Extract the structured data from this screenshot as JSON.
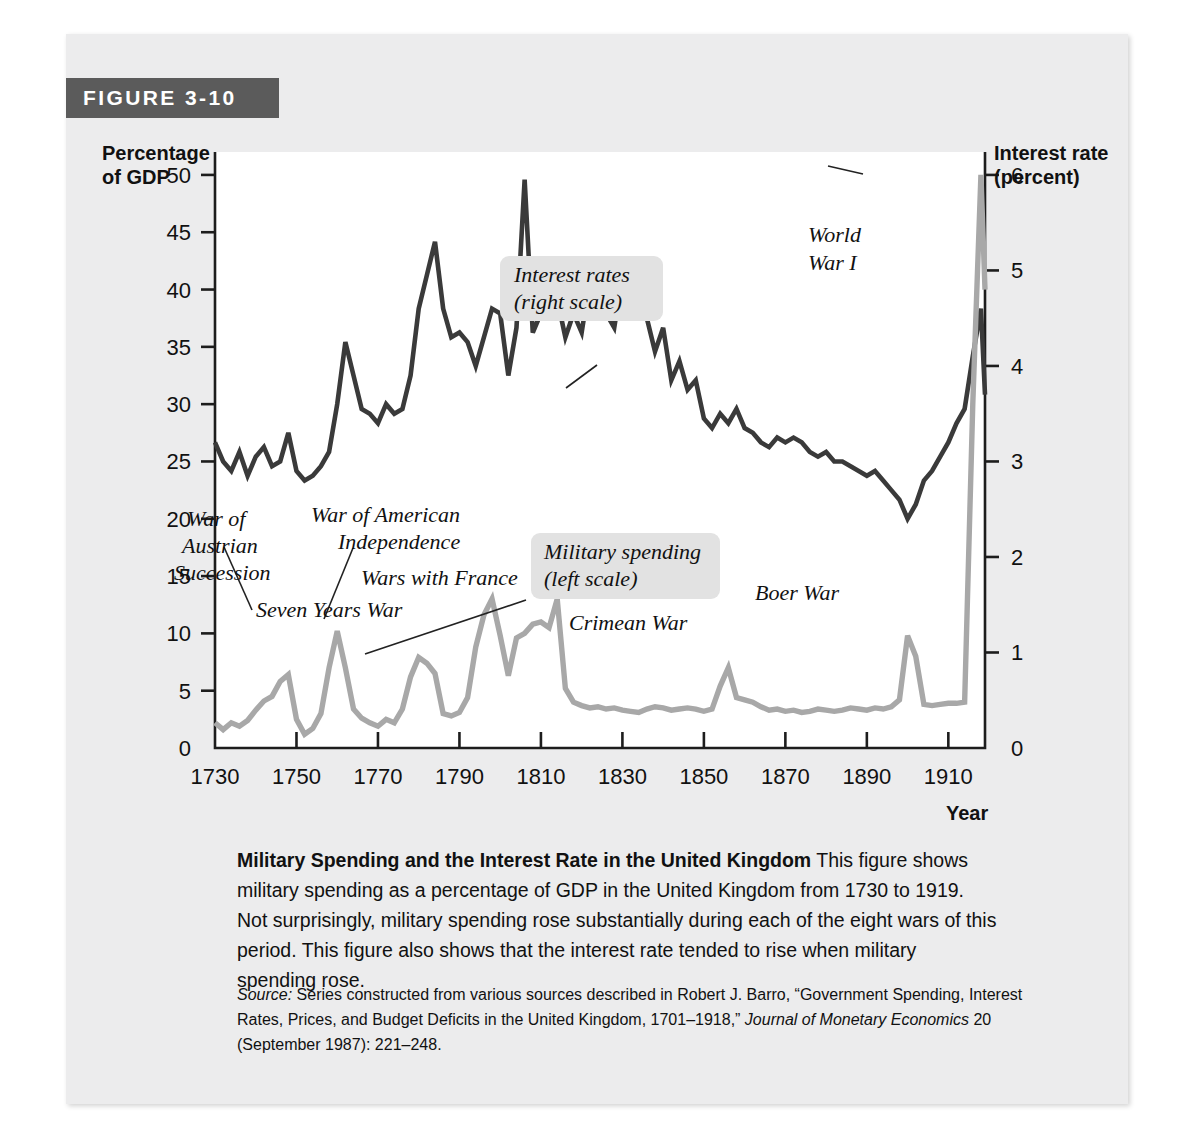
{
  "figure": {
    "banner_label": "FIGURE 3-10",
    "caption_bold": "Military Spending and the Interest Rate in the United Kingdom",
    "caption_body": " This figure shows military spending as a percentage of GDP in the United Kingdom from 1730 to 1919. Not surprisingly, military spending rose substantially during each of the eight wars of this period. This figure also shows that the interest rate tended to rise when military spending rose.",
    "source_label": "Source:",
    "source_body": " Series constructed from various sources described in Robert J. Barro, “Government Spending, Interest Rates, Prices, and Budget Deficits in the United Kingdom, 1701–1918,” ",
    "source_italic_1": "Journal of Monetary Economics",
    "source_tail": " 20 (September 1987): 221–248."
  },
  "chart_data": {
    "type": "line",
    "title": "Military Spending and the Interest Rate in the United Kingdom",
    "xlabel": "Year",
    "ylabel_left": "Percentage\nof GDP",
    "ylabel_left_line1": "Percentage",
    "ylabel_left_line2": "of GDP",
    "ylabel_right_line1": "Interest rate",
    "ylabel_right_line2": "(percent)",
    "xlim": [
      1730,
      1919
    ],
    "ylim_left": [
      0,
      52
    ],
    "ylim_right": [
      0,
      6.24
    ],
    "grid": false,
    "x_ticks": [
      1730,
      1750,
      1770,
      1790,
      1810,
      1830,
      1850,
      1870,
      1890,
      1910
    ],
    "y_ticks_left": [
      0,
      5,
      10,
      15,
      20,
      25,
      30,
      35,
      40,
      45,
      50
    ],
    "y_ticks_right": [
      0,
      1,
      2,
      3,
      4,
      5,
      6
    ],
    "colors": {
      "interest_rate": "#3a3a3a",
      "military_spending": "#a8a8a8",
      "banner": "#5b5b5b",
      "card": "#ececed",
      "callout_box": "#e2e2e2"
    },
    "series": [
      {
        "name": "Interest rates (right scale)",
        "axis": "right",
        "color": "#3a3a3a",
        "x": [
          1730,
          1732,
          1734,
          1736,
          1738,
          1740,
          1742,
          1744,
          1746,
          1748,
          1750,
          1752,
          1754,
          1756,
          1758,
          1760,
          1762,
          1764,
          1766,
          1768,
          1770,
          1772,
          1774,
          1776,
          1778,
          1780,
          1782,
          1784,
          1786,
          1788,
          1790,
          1792,
          1794,
          1796,
          1798,
          1800,
          1802,
          1804,
          1806,
          1808,
          1810,
          1812,
          1814,
          1816,
          1818,
          1820,
          1822,
          1824,
          1826,
          1828,
          1830,
          1832,
          1834,
          1836,
          1838,
          1840,
          1842,
          1844,
          1846,
          1848,
          1850,
          1852,
          1854,
          1856,
          1858,
          1860,
          1862,
          1864,
          1866,
          1868,
          1870,
          1872,
          1874,
          1876,
          1878,
          1880,
          1882,
          1884,
          1886,
          1888,
          1890,
          1892,
          1894,
          1896,
          1898,
          1900,
          1902,
          1904,
          1906,
          1908,
          1910,
          1912,
          1914,
          1916,
          1918,
          1919
        ],
        "y": [
          3.2,
          3.0,
          2.9,
          3.1,
          2.85,
          3.05,
          3.15,
          2.95,
          3.0,
          3.3,
          2.9,
          2.8,
          2.85,
          2.95,
          3.1,
          3.6,
          4.25,
          3.9,
          3.55,
          3.5,
          3.4,
          3.6,
          3.5,
          3.55,
          3.9,
          4.6,
          4.95,
          5.3,
          4.6,
          4.3,
          4.35,
          4.25,
          4.0,
          4.3,
          4.6,
          4.55,
          3.9,
          4.4,
          5.95,
          4.35,
          4.55,
          5.0,
          4.7,
          4.3,
          4.55,
          4.35,
          4.9,
          4.85,
          4.55,
          4.4,
          4.95,
          5.05,
          4.75,
          4.5,
          4.15,
          4.4,
          3.85,
          4.05,
          3.75,
          3.85,
          3.45,
          3.35,
          3.5,
          3.4,
          3.55,
          3.35,
          3.3,
          3.2,
          3.15,
          3.25,
          3.2,
          3.25,
          3.2,
          3.1,
          3.05,
          3.1,
          3.0,
          3.0,
          2.95,
          2.9,
          2.85,
          2.9,
          2.8,
          2.7,
          2.6,
          2.4,
          2.55,
          2.8,
          2.9,
          3.05,
          3.2,
          3.4,
          3.55,
          4.1,
          4.6,
          3.7
        ]
      },
      {
        "name": "Military spending (left scale)",
        "axis": "left",
        "color": "#a8a8a8",
        "x": [
          1730,
          1732,
          1734,
          1736,
          1738,
          1740,
          1742,
          1744,
          1746,
          1748,
          1750,
          1752,
          1754,
          1756,
          1758,
          1760,
          1762,
          1764,
          1766,
          1768,
          1770,
          1772,
          1774,
          1776,
          1778,
          1780,
          1782,
          1784,
          1786,
          1788,
          1790,
          1792,
          1794,
          1796,
          1798,
          1800,
          1802,
          1804,
          1806,
          1808,
          1810,
          1812,
          1814,
          1816,
          1818,
          1820,
          1822,
          1824,
          1826,
          1828,
          1830,
          1832,
          1834,
          1836,
          1838,
          1840,
          1842,
          1844,
          1846,
          1848,
          1850,
          1852,
          1854,
          1856,
          1858,
          1860,
          1862,
          1864,
          1866,
          1868,
          1870,
          1872,
          1874,
          1876,
          1878,
          1880,
          1882,
          1884,
          1886,
          1888,
          1890,
          1892,
          1894,
          1896,
          1898,
          1900,
          1902,
          1904,
          1906,
          1908,
          1910,
          1912,
          1914,
          1916,
          1918,
          1919
        ],
        "y": [
          2.2,
          1.6,
          2.2,
          1.9,
          2.4,
          3.3,
          4.1,
          4.5,
          5.8,
          6.4,
          2.5,
          1.2,
          1.7,
          3.0,
          7.0,
          10.2,
          7.0,
          3.4,
          2.6,
          2.2,
          1.9,
          2.5,
          2.2,
          3.4,
          6.2,
          7.9,
          7.4,
          6.5,
          3.0,
          2.8,
          3.1,
          4.4,
          8.8,
          11.6,
          13.0,
          9.8,
          6.3,
          9.6,
          10.0,
          10.8,
          11.0,
          10.5,
          13.0,
          5.2,
          4.0,
          3.7,
          3.5,
          3.6,
          3.4,
          3.5,
          3.3,
          3.2,
          3.1,
          3.4,
          3.6,
          3.5,
          3.3,
          3.4,
          3.5,
          3.4,
          3.2,
          3.4,
          5.4,
          7.0,
          4.4,
          4.2,
          4.0,
          3.6,
          3.3,
          3.4,
          3.2,
          3.3,
          3.1,
          3.2,
          3.4,
          3.3,
          3.2,
          3.3,
          3.5,
          3.4,
          3.3,
          3.5,
          3.4,
          3.6,
          4.2,
          9.8,
          8.0,
          3.8,
          3.7,
          3.8,
          3.9,
          3.9,
          4.0,
          30.0,
          50.0,
          40.0
        ]
      }
    ],
    "annotations": [
      {
        "id": "war-of-austrian-succession",
        "lines": [
          "War of",
          "Austrian",
          "Succession"
        ],
        "boxed": false
      },
      {
        "id": "seven-years-war",
        "lines": [
          "Seven Years War"
        ],
        "boxed": false
      },
      {
        "id": "war-of-american-independence",
        "lines": [
          "War of American",
          "Independence"
        ],
        "boxed": false
      },
      {
        "id": "wars-with-france",
        "lines": [
          "Wars with France"
        ],
        "boxed": false
      },
      {
        "id": "crimean-war",
        "lines": [
          "Crimean War"
        ],
        "boxed": false
      },
      {
        "id": "boer-war",
        "lines": [
          "Boer War"
        ],
        "boxed": false
      },
      {
        "id": "world-war-i",
        "lines": [
          "World",
          "War I"
        ],
        "boxed": false
      },
      {
        "id": "interest-rates-legend",
        "lines": [
          "Interest rates",
          "(right scale)"
        ],
        "boxed": true
      },
      {
        "id": "military-spending-legend",
        "lines": [
          "Military spending",
          "(left scale)"
        ],
        "boxed": true
      }
    ]
  }
}
